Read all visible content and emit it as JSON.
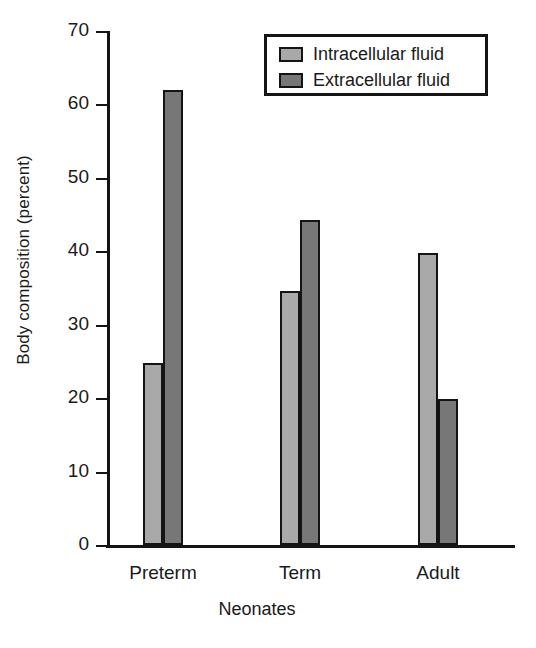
{
  "chart_data": {
    "type": "bar",
    "title": "",
    "xlabel": "Neonates",
    "ylabel": "Body composition (percent)",
    "ylim": [
      0,
      70
    ],
    "ytick_labels": [
      "70",
      "60",
      "50",
      "40",
      "30",
      "20",
      "10",
      "0"
    ],
    "yticks": [
      70,
      60,
      50,
      40,
      30,
      20,
      10,
      0
    ],
    "grid": false,
    "legend_position": "top-right",
    "categories": [
      "Preterm",
      "Term",
      "Adult"
    ],
    "series": [
      {
        "name": "Intracellular fluid",
        "color": "#a9a9a9",
        "values": [
          24.8,
          34.6,
          39.8
        ]
      },
      {
        "name": "Extracellular fluid",
        "color": "#777777",
        "values": [
          61.9,
          44.3,
          19.9
        ]
      }
    ]
  },
  "legend": {
    "entries": [
      {
        "label": "Intracellular fluid",
        "swatch": "light-gray-swatch"
      },
      {
        "label": "Extracellular fluid",
        "swatch": "dark-gray-swatch"
      }
    ]
  },
  "axes": {
    "y_title": "Body composition (percent)",
    "x_title": "Neonates"
  },
  "colors": {
    "intracellular": "#a9a9a9",
    "extracellular": "#777777",
    "axis": "#141414",
    "background": "#ffffff"
  }
}
